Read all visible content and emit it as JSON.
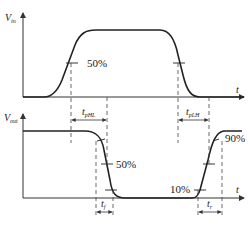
{
  "diagram": {
    "type": "timing-diagram",
    "colors": {
      "stroke": "#222222",
      "axis": "#333333",
      "dashed": "#444444",
      "background": "#ffffff"
    },
    "input_plot": {
      "y_label_main": "V",
      "y_label_sub": "in",
      "x_label": "t",
      "marker_label": "50%"
    },
    "output_plot": {
      "y_label_main": "V",
      "y_label_sub": "out",
      "x_label": "t",
      "marker_labels": {
        "mid": "50%",
        "low": "10%",
        "high": "90%"
      }
    },
    "intervals": {
      "tphl_main": "t",
      "tphl_sub": "pHL",
      "tplh_main": "t",
      "tplh_sub": "pLH",
      "tf_main": "t",
      "tf_sub": "f",
      "tr_main": "t",
      "tr_sub": "r"
    }
  }
}
